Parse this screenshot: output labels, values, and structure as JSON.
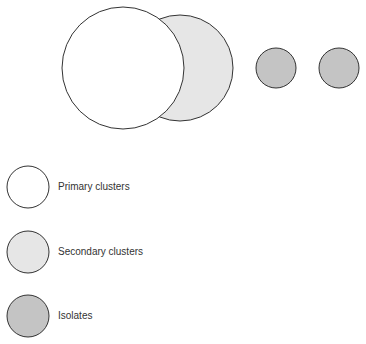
{
  "diagram": {
    "colors": {
      "primary_fill": "#ffffff",
      "secondary_fill": "#e6e6e6",
      "isolate_fill": "#c4c4c4",
      "stroke": "#333333"
    },
    "top_row": [
      {
        "type": "secondary",
        "label": "Secondary cluster"
      },
      {
        "type": "primary",
        "label": "Primary cluster"
      },
      {
        "type": "isolate",
        "label": "Isolate"
      },
      {
        "type": "isolate",
        "label": "Isolate"
      }
    ]
  },
  "legend": {
    "items": [
      {
        "type": "primary",
        "label": "Primary clusters"
      },
      {
        "type": "secondary",
        "label": "Secondary clusters"
      },
      {
        "type": "isolate",
        "label": "Isolates"
      }
    ]
  }
}
